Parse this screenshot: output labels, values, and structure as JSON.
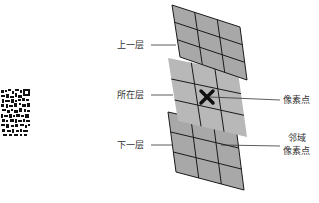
{
  "diagram": {
    "labels": {
      "upper_layer": "上一层",
      "current_layer": "所在层",
      "lower_layer": "下一层",
      "pixel": "像素点",
      "neighbor_line1": "邻域",
      "neighbor_line2": "像素点"
    },
    "layers": [
      {
        "name": "upper",
        "rows": 3,
        "cols": 3,
        "fill": "#a8a8a8",
        "stroke": "#1a1a1a"
      },
      {
        "name": "current",
        "rows": 3,
        "cols": 3,
        "fill": "#b8b8b8",
        "stroke": "#1a1a1a"
      },
      {
        "name": "lower",
        "rows": 3,
        "cols": 3,
        "fill": "#a8a8a8",
        "stroke": "#1a1a1a"
      }
    ],
    "marker": {
      "symbol": "x-mark",
      "color": "#111111"
    },
    "qr_code": {
      "present": true
    }
  }
}
